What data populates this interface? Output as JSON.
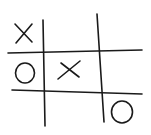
{
  "game": {
    "name": "Tic-Tac-Toe",
    "board": [
      [
        "X",
        "",
        ""
      ],
      [
        "O",
        "X",
        ""
      ],
      [
        "",
        "",
        "O"
      ]
    ],
    "ink_color": "#1a1a1a",
    "background_color": "#ffffff"
  }
}
